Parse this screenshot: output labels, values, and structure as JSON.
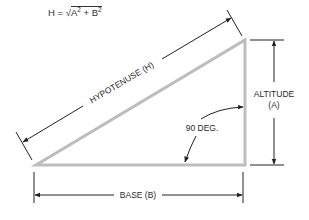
{
  "formula": {
    "lhs": "H",
    "eq": "=",
    "radical": "√",
    "term_a": "A",
    "exp_a": "2",
    "plus": "+",
    "term_b": "B",
    "exp_b": "2"
  },
  "labels": {
    "hypotenuse": "HYPOTENUSE (H)",
    "altitude_line1": "ALTITUDE",
    "altitude_line2": "(A)",
    "base": "BASE (B)",
    "angle": "90 DEG."
  },
  "colors": {
    "triangle_stroke": "#bdbdbd",
    "dimension_line": "#222222",
    "text": "#2a2a2a"
  }
}
